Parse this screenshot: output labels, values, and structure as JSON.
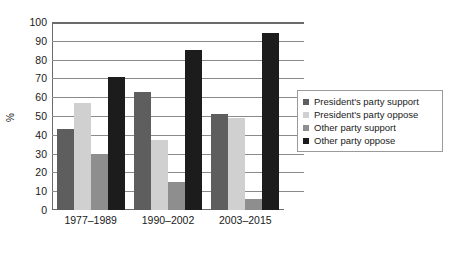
{
  "chart_data": {
    "type": "bar",
    "title": "",
    "subtitle": "",
    "xlabel": "",
    "ylabel": "%",
    "ylim": [
      0,
      100
    ],
    "ytick_step": 10,
    "yticks": [
      0,
      10,
      20,
      30,
      40,
      50,
      60,
      70,
      80,
      90,
      100
    ],
    "grid": true,
    "grid_axis": "y",
    "legend_position": "right",
    "categories": [
      "1977–1989",
      "1990–2002",
      "2003–2015"
    ],
    "series": [
      {
        "name": "President's party support",
        "color": "#5e5e5e",
        "values": [
          43,
          63,
          51
        ]
      },
      {
        "name": "President's party oppose",
        "color": "#d0d0d0",
        "values": [
          57,
          37,
          49
        ]
      },
      {
        "name": "Other party support",
        "color": "#8e8e8e",
        "values": [
          30,
          15,
          6
        ]
      },
      {
        "name": "Other party oppose",
        "color": "#1c1c1c",
        "values": [
          71,
          85,
          94
        ]
      }
    ]
  }
}
